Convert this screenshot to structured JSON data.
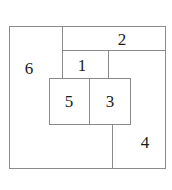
{
  "figure": {
    "type": "squared-rectangle-dissection",
    "background_color": "#ffffff",
    "line_color": "#8a8a8a",
    "text_color": "#1b1b1b",
    "canvas": {
      "width": 172,
      "height": 190
    },
    "outer_square": {
      "x": 9,
      "y": 26,
      "width": 156,
      "height": 142
    }
  },
  "regions": [
    {
      "id": "region-6",
      "label": "6",
      "x": 9,
      "y": 26,
      "width": 53,
      "height": 142,
      "label_x": 29,
      "label_y": 68
    },
    {
      "id": "region-2",
      "label": "2",
      "x": 62,
      "y": 26,
      "width": 103,
      "height": 24,
      "label_x": 122,
      "label_y": 39
    },
    {
      "id": "region-1",
      "label": "1",
      "x": 62,
      "y": 50,
      "width": 46,
      "height": 28,
      "label_x": 82,
      "label_y": 65
    },
    {
      "id": "region-5",
      "label": "5",
      "x": 49,
      "y": 78,
      "width": 40,
      "height": 46,
      "label_x": 69,
      "label_y": 101
    },
    {
      "id": "region-3",
      "label": "3",
      "x": 89,
      "y": 78,
      "width": 41,
      "height": 46,
      "label_x": 110,
      "label_y": 101
    },
    {
      "id": "region-4",
      "label": "4",
      "x": 112,
      "y": 50,
      "width": 53,
      "height": 118,
      "label_x": 145,
      "label_y": 142
    }
  ],
  "segments": [
    {
      "id": "outer-top",
      "x": 9,
      "y": 26,
      "width": 157,
      "height": 1
    },
    {
      "id": "outer-bottom",
      "x": 9,
      "y": 168,
      "width": 157,
      "height": 1
    },
    {
      "id": "outer-left",
      "x": 9,
      "y": 26,
      "width": 1,
      "height": 143
    },
    {
      "id": "outer-right",
      "x": 165,
      "y": 26,
      "width": 1,
      "height": 143
    },
    {
      "id": "divider-6-right",
      "x": 62,
      "y": 26,
      "width": 1,
      "height": 53
    },
    {
      "id": "divider-2-bottom",
      "x": 62,
      "y": 50,
      "width": 104,
      "height": 1
    },
    {
      "id": "divider-1-right",
      "x": 108,
      "y": 50,
      "width": 1,
      "height": 29
    },
    {
      "id": "divider-53-top",
      "x": 49,
      "y": 78,
      "width": 82,
      "height": 1
    },
    {
      "id": "divider-53-bottom",
      "x": 49,
      "y": 124,
      "width": 82,
      "height": 1
    },
    {
      "id": "divider-53-left",
      "x": 49,
      "y": 78,
      "width": 1,
      "height": 47
    },
    {
      "id": "divider-53-right",
      "x": 130,
      "y": 78,
      "width": 1,
      "height": 47
    },
    {
      "id": "divider-5-3-middle",
      "x": 89,
      "y": 78,
      "width": 1,
      "height": 47
    },
    {
      "id": "divider-4-left",
      "x": 112,
      "y": 124,
      "width": 1,
      "height": 45
    }
  ]
}
